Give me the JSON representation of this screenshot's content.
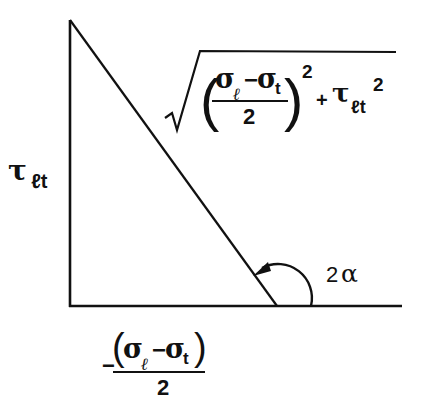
{
  "diagram": {
    "type": "right-triangle geometric construction (Mohr circle relation)",
    "colors": {
      "line": "#111111",
      "background": "#ffffff"
    },
    "labels": {
      "vertical_side": {
        "symbol": "τ",
        "subscript": "ℓt"
      },
      "hypotenuse": {
        "radical": "√",
        "numerator_a": "σ",
        "numerator_a_sub": "ℓ",
        "minus": "−",
        "numerator_b": "σ",
        "numerator_b_sub": "t",
        "denominator": "2",
        "open_paren": "(",
        "close_paren": ")",
        "exponent": "2",
        "plus": "+",
        "tau": "τ",
        "tau_sub": "ℓt",
        "tau_exp": "2"
      },
      "horizontal_side": {
        "sign": "−",
        "open_paren": "(",
        "close_paren": ")",
        "numerator_a": "σ",
        "numerator_a_sub": "ℓ",
        "minus": "−",
        "numerator_b": "σ",
        "numerator_b_sub": "t",
        "denominator": "2"
      },
      "angle": {
        "coefficient": "2",
        "symbol": "α"
      }
    },
    "geometry": {
      "vertical_line": {
        "x": 70,
        "y1": 20,
        "y2": 306
      },
      "base_line": {
        "x1": 70,
        "x2": 402,
        "y": 306
      },
      "hypotenuse": {
        "x1": 70,
        "y1": 20,
        "x2": 277,
        "y2": 306
      },
      "sqrt_bar": {
        "x1": 199,
        "x2": 395,
        "y": 52
      }
    }
  }
}
